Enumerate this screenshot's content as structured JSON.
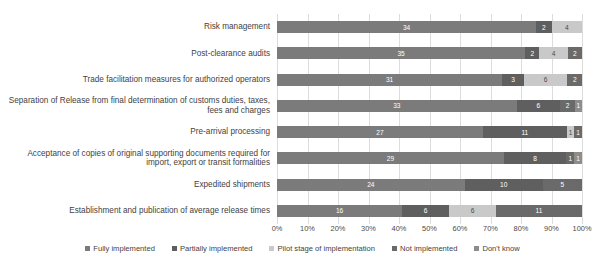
{
  "chart_data": {
    "type": "bar",
    "orientation": "horizontal",
    "stacked": true,
    "normalized_percent": true,
    "title": "",
    "xlabel": "",
    "ylabel": "",
    "xlim": [
      0,
      100
    ],
    "grid": true,
    "legend_position": "bottom",
    "axis_ticks": [
      "0%",
      "10%",
      "20%",
      "30%",
      "40%",
      "50%",
      "60%",
      "70%",
      "80%",
      "90%",
      "100%"
    ],
    "axis_tick_values": [
      0,
      10,
      20,
      30,
      40,
      50,
      60,
      70,
      80,
      90,
      100
    ],
    "categories": [
      "Risk management",
      "Post-clearance audits",
      "Trade facilitation measures for authorized operators",
      "Separation of Release from final determination of customs duties, taxes,\nfees and charges",
      "Pre-arrival processing",
      "Acceptance of copies of original supporting documents required for\nimport, export or transit formalities",
      "Expedited shipments",
      "Establishment and publication of average release times"
    ],
    "series": [
      {
        "name": "Fully implemented",
        "color": "#7b7b7b",
        "values": [
          34,
          35,
          31,
          33,
          27,
          29,
          24,
          16
        ]
      },
      {
        "name": "Partially implemented",
        "color": "#5f5f5f",
        "values": [
          2,
          2,
          3,
          6,
          11,
          8,
          10,
          6
        ]
      },
      {
        "name": "Pilot stage of implementation",
        "color": "#c9c9c9",
        "values": [
          4,
          4,
          6,
          0,
          1,
          0,
          0,
          6
        ]
      },
      {
        "name": "Not implemented",
        "color": "#6a6a6a",
        "values": [
          0,
          2,
          2,
          2,
          1,
          1,
          5,
          11
        ]
      },
      {
        "name": "Don't know",
        "color": "#8d8d8d",
        "values": [
          0,
          0,
          0,
          1,
          0,
          1,
          0,
          0
        ]
      }
    ],
    "data_labels": [
      [
        "34",
        "2",
        "4",
        "0",
        "0"
      ],
      [
        "35",
        "2",
        "4",
        "2",
        "0"
      ],
      [
        "31",
        "3",
        "6",
        "2",
        "0"
      ],
      [
        "33",
        "6",
        "0",
        "2",
        "1"
      ],
      [
        "27",
        "11",
        "1",
        "1",
        "0"
      ],
      [
        "29",
        "8",
        "0",
        "1",
        "1"
      ],
      [
        "24",
        "10",
        "0",
        "5",
        "0"
      ],
      [
        "16",
        "6",
        "6",
        "11",
        "0"
      ]
    ]
  }
}
